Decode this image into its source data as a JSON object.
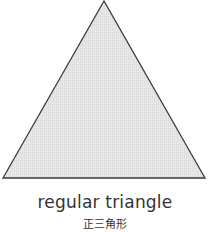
{
  "diagram": {
    "shape": "regular-triangle",
    "fill_color": "#e4e4e4",
    "stroke_color": "#3a3a3a",
    "vertices": [
      [
        104,
        1
      ],
      [
        3,
        178
      ],
      [
        205,
        178
      ]
    ]
  },
  "labels": {
    "english": "regular triangle",
    "japanese": "正三角形"
  }
}
